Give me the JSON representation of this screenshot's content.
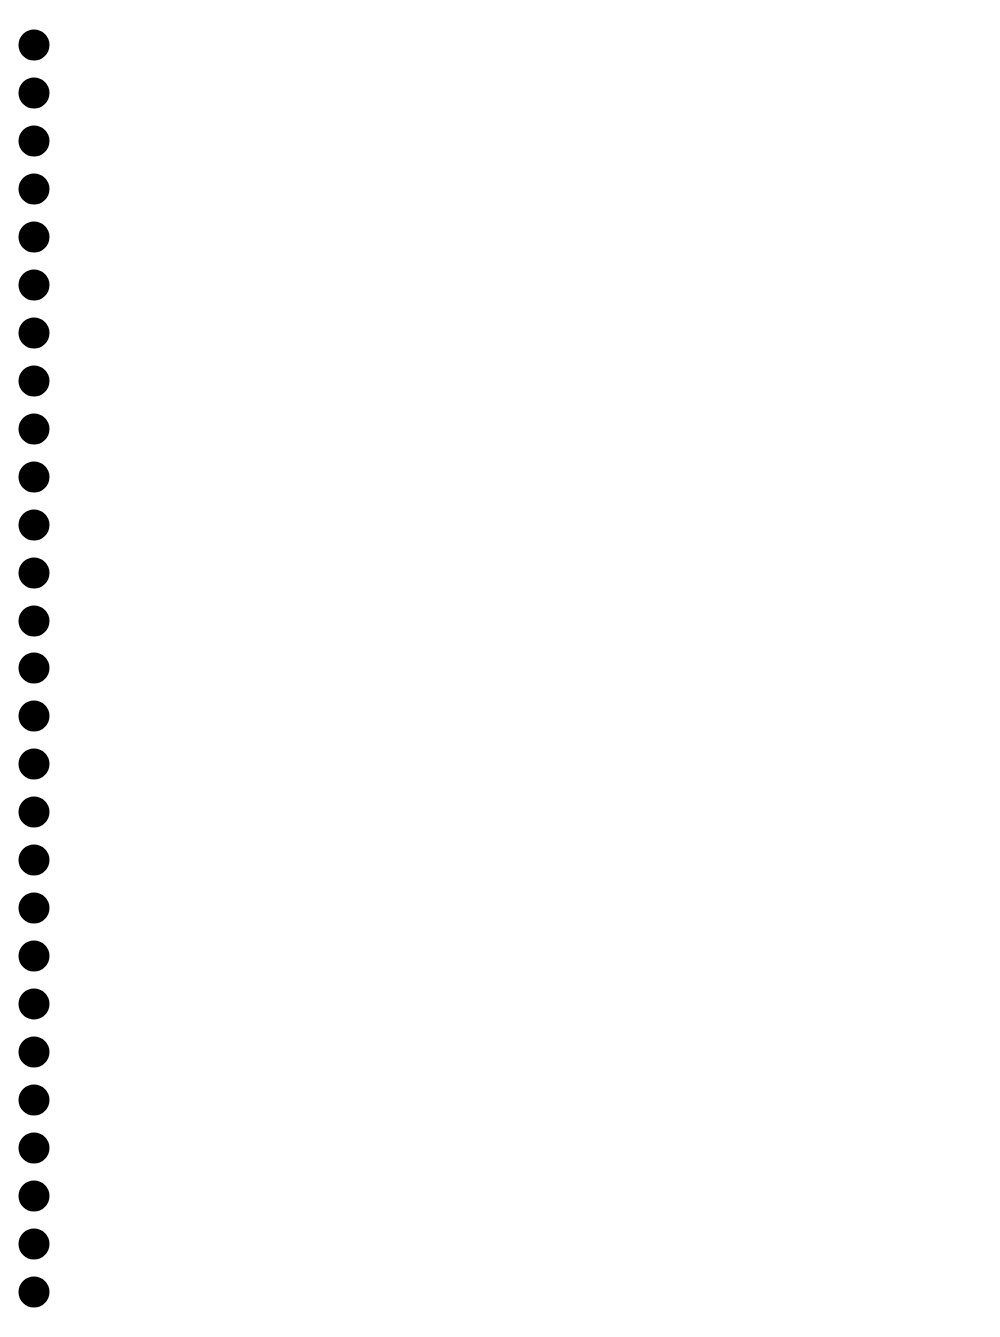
{
  "page": {
    "background": "#ffffff",
    "width": 1000,
    "height": 1337,
    "content_text": ""
  },
  "punch_holes": {
    "count": 27,
    "color": "#000000",
    "diameter": 31,
    "x": 34,
    "y_positions": [
      45,
      93,
      141,
      189,
      237,
      285,
      333,
      381,
      429,
      477,
      525,
      573,
      621,
      668,
      716,
      764,
      812,
      860,
      908,
      956,
      1004,
      1052,
      1100,
      1148,
      1196,
      1244,
      1292
    ]
  }
}
